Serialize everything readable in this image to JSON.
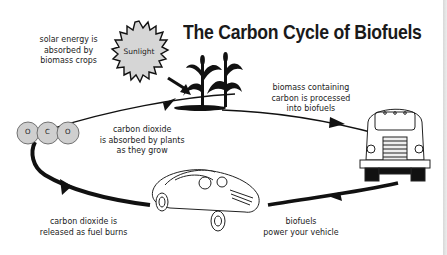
{
  "title": "The Carbon Cycle of Biofuels",
  "sun": {
    "label": "Sunlight",
    "fill": "#d6d6d6"
  },
  "molecule": {
    "atoms": [
      "O",
      "C",
      "O"
    ],
    "fill": "#cfcfcf"
  },
  "labels": {
    "solar": [
      "solar energy is",
      "absorbed by",
      "biomass crops"
    ],
    "processed": [
      "biomass containing",
      "carbon is processed",
      "into biofuels"
    ],
    "absorbed": [
      "carbon dioxide",
      "is absorbed by plants",
      "as they grow"
    ],
    "released": [
      "carbon dioxide is",
      "released as fuel burns"
    ],
    "power": [
      "biofuels",
      "power your vehicle"
    ]
  },
  "colors": {
    "ink": "#111111",
    "text": "#222222",
    "background": "#ffffff",
    "edge": "#dcdcdc"
  }
}
